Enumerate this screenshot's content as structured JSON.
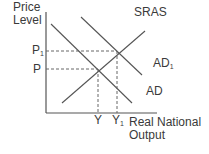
{
  "diagram": {
    "y_axis_label_line1": "Price",
    "y_axis_label_line2": "Level",
    "x_axis_label_line1": "Real National",
    "x_axis_label_line2": "Output",
    "curves": {
      "sras": "SRAS",
      "ad1": "AD",
      "ad1_sub": "1",
      "ad": "AD"
    },
    "price_levels": {
      "p1": "P",
      "p1_sub": "1",
      "p": "P"
    },
    "outputs": {
      "y": "Y",
      "y1": "Y",
      "y1_sub": "1"
    },
    "colors": {
      "line": "#4a4a4a",
      "text": "#3a3a3a"
    }
  }
}
